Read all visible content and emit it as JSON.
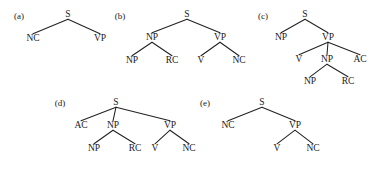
{
  "figure": {
    "caption_style": "lettered-panels",
    "background_color": "#ffffff",
    "ink_color": "#1a1a1a",
    "edge_color": "#222222",
    "panels": [
      {
        "id": "a",
        "label": "(a)",
        "label_pos": [
          19,
          19
        ],
        "nodes": [
          {
            "name": "S",
            "text": "S",
            "x": 68,
            "y": 17
          },
          {
            "name": "NC",
            "text": "NC",
            "x": 33,
            "y": 41
          },
          {
            "name": "VP",
            "text": "VP",
            "x": 100,
            "y": 41
          }
        ],
        "edges": [
          {
            "from": "S",
            "to": "NC"
          },
          {
            "from": "S",
            "to": "VP"
          }
        ]
      },
      {
        "id": "b",
        "label": "(b)",
        "label_pos": [
          120,
          19
        ],
        "nodes": [
          {
            "name": "S",
            "text": "S",
            "x": 187,
            "y": 17
          },
          {
            "name": "NP1",
            "text": "NP",
            "x": 152,
            "y": 40
          },
          {
            "name": "VP",
            "text": "VP",
            "x": 220,
            "y": 40
          },
          {
            "name": "NP2",
            "text": "NP",
            "x": 132,
            "y": 63
          },
          {
            "name": "RC",
            "text": "RC",
            "x": 172,
            "y": 63
          },
          {
            "name": "V",
            "text": "V",
            "x": 201,
            "y": 63
          },
          {
            "name": "NC",
            "text": "NC",
            "x": 239,
            "y": 63
          }
        ],
        "edges": [
          {
            "from": "S",
            "to": "NP1"
          },
          {
            "from": "S",
            "to": "VP"
          },
          {
            "from": "NP1",
            "to": "NP2"
          },
          {
            "from": "NP1",
            "to": "RC"
          },
          {
            "from": "VP",
            "to": "V"
          },
          {
            "from": "VP",
            "to": "NC"
          }
        ]
      },
      {
        "id": "c",
        "label": "(c)",
        "label_pos": [
          263,
          19
        ],
        "nodes": [
          {
            "name": "S",
            "text": "S",
            "x": 305,
            "y": 17
          },
          {
            "name": "NP1",
            "text": "NP",
            "x": 281,
            "y": 40
          },
          {
            "name": "VP",
            "text": "VP",
            "x": 328,
            "y": 40
          },
          {
            "name": "V",
            "text": "V",
            "x": 299,
            "y": 62
          },
          {
            "name": "NP2",
            "text": "NP",
            "x": 327,
            "y": 62
          },
          {
            "name": "AC",
            "text": "AC",
            "x": 360,
            "y": 62
          },
          {
            "name": "NP3",
            "text": "NP",
            "x": 310,
            "y": 84
          },
          {
            "name": "RC",
            "text": "RC",
            "x": 348,
            "y": 84
          }
        ],
        "edges": [
          {
            "from": "S",
            "to": "NP1"
          },
          {
            "from": "S",
            "to": "VP"
          },
          {
            "from": "VP",
            "to": "V"
          },
          {
            "from": "VP",
            "to": "NP2"
          },
          {
            "from": "VP",
            "to": "AC"
          },
          {
            "from": "NP2",
            "to": "NP3"
          },
          {
            "from": "NP2",
            "to": "RC"
          }
        ]
      },
      {
        "id": "d",
        "label": "(d)",
        "label_pos": [
          60,
          106
        ],
        "nodes": [
          {
            "name": "S",
            "text": "S",
            "x": 116,
            "y": 105
          },
          {
            "name": "AC",
            "text": "AC",
            "x": 81,
            "y": 128
          },
          {
            "name": "NP1",
            "text": "NP",
            "x": 113,
            "y": 128
          },
          {
            "name": "VP",
            "text": "VP",
            "x": 170,
            "y": 128
          },
          {
            "name": "NP2",
            "text": "NP",
            "x": 94,
            "y": 151
          },
          {
            "name": "RC",
            "text": "RC",
            "x": 135,
            "y": 151
          },
          {
            "name": "V",
            "text": "V",
            "x": 155,
            "y": 151
          },
          {
            "name": "NC",
            "text": "NC",
            "x": 189,
            "y": 151
          }
        ],
        "edges": [
          {
            "from": "S",
            "to": "AC"
          },
          {
            "from": "S",
            "to": "NP1"
          },
          {
            "from": "S",
            "to": "VP"
          },
          {
            "from": "NP1",
            "to": "NP2"
          },
          {
            "from": "NP1",
            "to": "RC"
          },
          {
            "from": "VP",
            "to": "V"
          },
          {
            "from": "VP",
            "to": "NC"
          }
        ]
      },
      {
        "id": "e",
        "label": "(e)",
        "label_pos": [
          205,
          106
        ],
        "nodes": [
          {
            "name": "S",
            "text": "S",
            "x": 262,
            "y": 105
          },
          {
            "name": "NC1",
            "text": "NC",
            "x": 228,
            "y": 128
          },
          {
            "name": "VP",
            "text": "VP",
            "x": 295,
            "y": 128
          },
          {
            "name": "V",
            "text": "V",
            "x": 277,
            "y": 151
          },
          {
            "name": "NC2",
            "text": "NC",
            "x": 313,
            "y": 151
          }
        ],
        "edges": [
          {
            "from": "S",
            "to": "NC1"
          },
          {
            "from": "S",
            "to": "VP"
          },
          {
            "from": "VP",
            "to": "V"
          },
          {
            "from": "VP",
            "to": "NC2"
          }
        ]
      }
    ]
  }
}
